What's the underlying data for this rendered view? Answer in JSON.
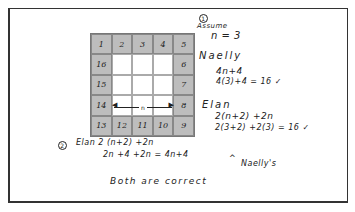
{
  "grid": {
    "size": 5,
    "border_numbers": {
      "top": [
        "1",
        "2",
        "3",
        "4",
        "5"
      ],
      "right": [
        "6",
        "7",
        "8"
      ],
      "bottom": [
        "9",
        "10",
        "11",
        "12",
        "13"
      ],
      "left": [
        "14",
        "15",
        "16"
      ]
    },
    "rows": [
      [
        "1",
        "2",
        "3",
        "4",
        "5"
      ],
      [
        "16",
        "",
        "",
        "",
        "6"
      ],
      [
        "15",
        "",
        "",
        "",
        "7"
      ],
      [
        "14",
        "",
        "",
        "",
        "8"
      ],
      [
        "13",
        "12",
        "11",
        "10",
        "9"
      ]
    ],
    "arrow_label": "n"
  },
  "notes": {
    "step1_marker": "1",
    "assume": "Assume",
    "n_value": "n = 3",
    "naelly_name": "Naelly",
    "naelly_expr": "4n+4",
    "naelly_calc": "4(3)+4 = 16 ✓",
    "elan_name": "Elan",
    "elan_expr": "2(n+2) +2n",
    "elan_calc": "2(3+2) +2(3) = 16 ✓",
    "step2_marker": "2",
    "step2_line1": "Elan 2 (n+2) +2n",
    "step2_line2": "2n +4 +2n  = 4n+4",
    "step2_caret": "^",
    "naellys": "Naelly's",
    "conclusion": "Both are correct"
  }
}
